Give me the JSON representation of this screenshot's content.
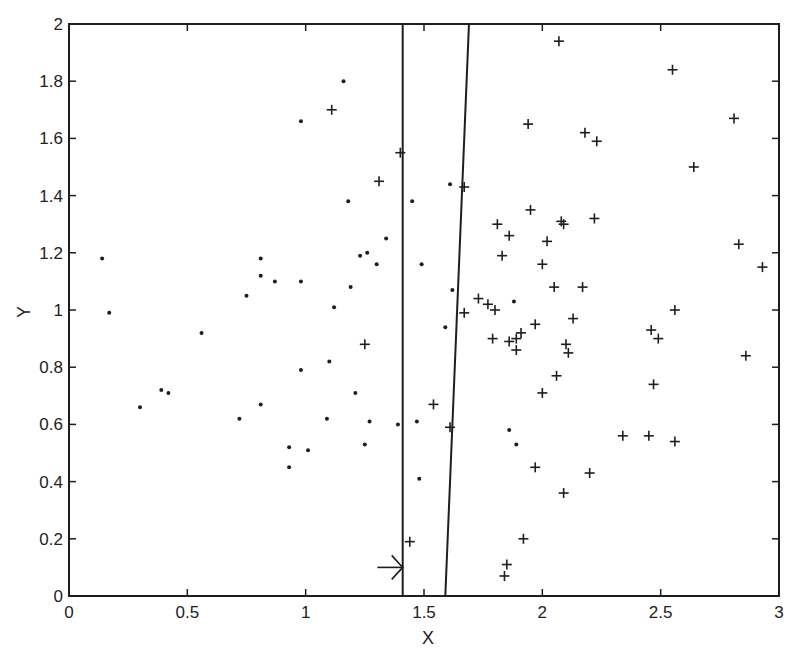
{
  "chart_data": {
    "type": "scatter",
    "title": "",
    "xlabel": "X",
    "ylabel": "Y",
    "xlim": [
      0,
      3
    ],
    "ylim": [
      0,
      2
    ],
    "grid": false,
    "legend": null,
    "xticks": [
      "0",
      "0.5",
      "1",
      "1.5",
      "2",
      "2.5",
      "3"
    ],
    "yticks": [
      "0",
      "0.2",
      "0.4",
      "0.6",
      "0.8",
      "1",
      "1.2",
      "1.4",
      "1.6",
      "1.8",
      "2"
    ],
    "lines": [
      {
        "name": "vertical-boundary",
        "x": [
          1.41,
          1.41
        ],
        "y": [
          0,
          2
        ]
      },
      {
        "name": "tilted-boundary",
        "x": [
          1.59,
          1.69
        ],
        "y": [
          0,
          2
        ]
      }
    ],
    "annotations": [
      {
        "type": "arrow",
        "from": [
          1.32,
          0.1
        ],
        "to": [
          1.41,
          0.1
        ]
      }
    ],
    "series": [
      {
        "name": "dots",
        "marker": "dot",
        "points": [
          [
            0.14,
            1.18
          ],
          [
            0.17,
            0.99
          ],
          [
            0.3,
            0.66
          ],
          [
            0.39,
            0.72
          ],
          [
            0.42,
            0.71
          ],
          [
            0.56,
            0.92
          ],
          [
            0.72,
            0.62
          ],
          [
            0.75,
            1.05
          ],
          [
            0.81,
            1.18
          ],
          [
            0.81,
            1.12
          ],
          [
            0.81,
            0.67
          ],
          [
            0.87,
            1.1
          ],
          [
            0.93,
            0.52
          ],
          [
            0.93,
            0.45
          ],
          [
            0.98,
            1.66
          ],
          [
            0.98,
            1.1
          ],
          [
            0.98,
            0.79
          ],
          [
            1.01,
            0.51
          ],
          [
            1.09,
            0.62
          ],
          [
            1.1,
            0.82
          ],
          [
            1.12,
            1.01
          ],
          [
            1.16,
            1.8
          ],
          [
            1.18,
            1.38
          ],
          [
            1.19,
            1.08
          ],
          [
            1.21,
            0.71
          ],
          [
            1.23,
            1.19
          ],
          [
            1.25,
            0.53
          ],
          [
            1.26,
            1.2
          ],
          [
            1.27,
            0.61
          ],
          [
            1.3,
            1.16
          ],
          [
            1.34,
            1.25
          ],
          [
            1.39,
            0.6
          ],
          [
            1.45,
            1.38
          ],
          [
            1.47,
            0.61
          ],
          [
            1.48,
            0.41
          ],
          [
            1.49,
            1.16
          ],
          [
            1.59,
            0.94
          ],
          [
            1.61,
            1.44
          ],
          [
            1.62,
            1.07
          ],
          [
            1.86,
            0.58
          ],
          [
            1.88,
            1.03
          ],
          [
            1.89,
            0.53
          ]
        ]
      },
      {
        "name": "plus",
        "marker": "plus",
        "points": [
          [
            1.11,
            1.7
          ],
          [
            1.31,
            1.45
          ],
          [
            1.25,
            0.88
          ],
          [
            1.4,
            1.55
          ],
          [
            1.44,
            0.19
          ],
          [
            1.54,
            0.67
          ],
          [
            1.61,
            0.59
          ],
          [
            1.67,
            1.43
          ],
          [
            1.67,
            0.99
          ],
          [
            1.73,
            1.04
          ],
          [
            1.77,
            1.02
          ],
          [
            1.79,
            0.9
          ],
          [
            1.8,
            1.0
          ],
          [
            1.81,
            1.3
          ],
          [
            1.83,
            1.19
          ],
          [
            1.84,
            0.07
          ],
          [
            1.85,
            0.11
          ],
          [
            1.86,
            1.26
          ],
          [
            1.86,
            0.89
          ],
          [
            1.89,
            0.9
          ],
          [
            1.89,
            0.86
          ],
          [
            1.91,
            0.92
          ],
          [
            1.92,
            0.2
          ],
          [
            1.94,
            1.65
          ],
          [
            1.95,
            1.35
          ],
          [
            1.97,
            0.45
          ],
          [
            1.97,
            0.95
          ],
          [
            2.0,
            0.71
          ],
          [
            2.0,
            1.16
          ],
          [
            2.02,
            1.24
          ],
          [
            2.05,
            1.08
          ],
          [
            2.06,
            0.77
          ],
          [
            2.07,
            1.94
          ],
          [
            2.08,
            1.31
          ],
          [
            2.09,
            0.36
          ],
          [
            2.09,
            1.3
          ],
          [
            2.1,
            0.88
          ],
          [
            2.11,
            0.85
          ],
          [
            2.13,
            0.97
          ],
          [
            2.17,
            1.08
          ],
          [
            2.18,
            1.62
          ],
          [
            2.2,
            0.43
          ],
          [
            2.22,
            1.32
          ],
          [
            2.23,
            1.59
          ],
          [
            2.34,
            0.56
          ],
          [
            2.45,
            0.56
          ],
          [
            2.46,
            0.93
          ],
          [
            2.47,
            0.74
          ],
          [
            2.49,
            0.9
          ],
          [
            2.55,
            1.84
          ],
          [
            2.56,
            0.54
          ],
          [
            2.56,
            1.0
          ],
          [
            2.64,
            1.5
          ],
          [
            2.81,
            1.67
          ],
          [
            2.83,
            1.23
          ],
          [
            2.86,
            0.84
          ],
          [
            2.93,
            1.15
          ]
        ]
      }
    ]
  },
  "colors": {
    "ink": "#1e1e1e",
    "background": "#ffffff"
  }
}
